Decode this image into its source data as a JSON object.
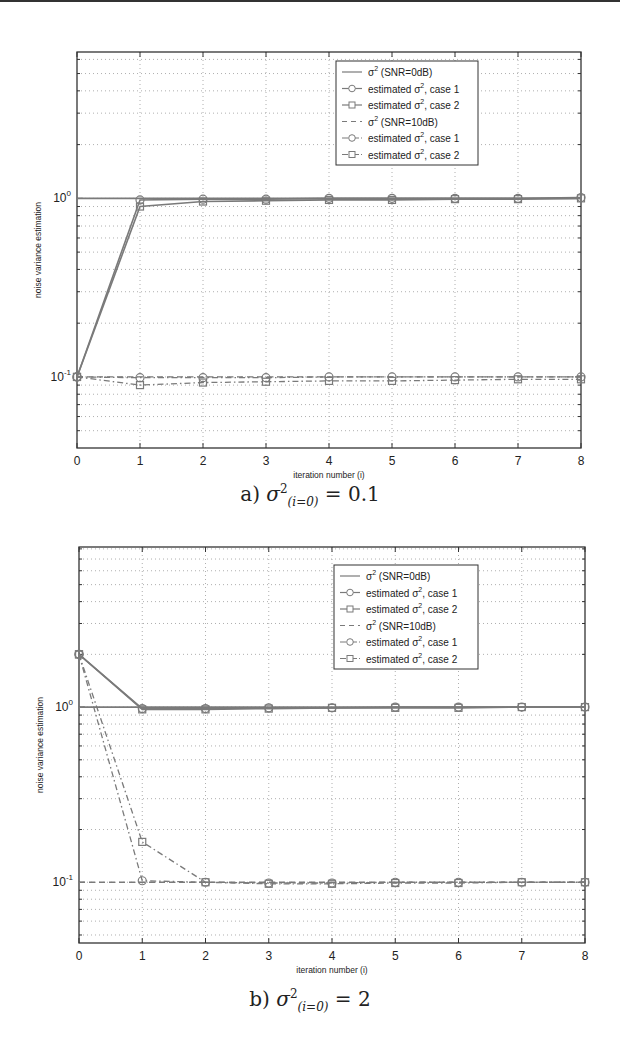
{
  "chart_data": [
    {
      "type": "line",
      "panel": "a",
      "title": "",
      "caption": {
        "prefix": "a)",
        "symbol": "σ",
        "sup": "2",
        "sub": "(i=0)",
        "suffix": "= 0.1"
      },
      "xlabel": "iteration number (i)",
      "ylabel": "noise variance estimation",
      "yscale": "log",
      "xlim": [
        0,
        8
      ],
      "ylim": [
        0.04,
        6.6
      ],
      "grid": true,
      "x_ticks": [
        "0",
        "1",
        "2",
        "3",
        "4",
        "5",
        "6",
        "7",
        "8"
      ],
      "y_ticks": [
        "10^-1",
        "10^0"
      ],
      "legend_position": "upper right (inside)",
      "x": [
        0,
        1,
        2,
        3,
        4,
        5,
        6,
        7,
        8
      ],
      "series": [
        {
          "name": "σ² (SNR=0dB)",
          "style": "solid",
          "marker": "none",
          "values": [
            1,
            1,
            1,
            1,
            1,
            1,
            1,
            1,
            1
          ]
        },
        {
          "name": "estimated σ², case 1",
          "style": "solid",
          "marker": "circle",
          "values": [
            0.1,
            0.98,
            0.99,
            0.99,
            1.0,
            1.0,
            1.0,
            1.0,
            1.01
          ]
        },
        {
          "name": "estimated σ², case 2",
          "style": "solid",
          "marker": "square",
          "values": [
            0.1,
            0.9,
            0.96,
            0.97,
            0.98,
            0.98,
            0.99,
            0.99,
            1.0
          ]
        },
        {
          "name": "σ² (SNR=10dB)",
          "style": "dashed",
          "marker": "none",
          "values": [
            0.1,
            0.1,
            0.1,
            0.1,
            0.1,
            0.1,
            0.1,
            0.1,
            0.1
          ]
        },
        {
          "name": "estimated σ², case 1",
          "style": "dashdot",
          "marker": "circle",
          "values": [
            0.1,
            0.099,
            0.099,
            0.099,
            0.1,
            0.1,
            0.1,
            0.1,
            0.1
          ]
        },
        {
          "name": "estimated σ², case 2",
          "style": "dashdot",
          "marker": "square",
          "values": [
            0.1,
            0.09,
            0.093,
            0.094,
            0.095,
            0.095,
            0.096,
            0.097,
            0.097
          ]
        }
      ]
    },
    {
      "type": "line",
      "panel": "b",
      "title": "",
      "caption": {
        "prefix": "b)",
        "symbol": "σ",
        "sup": "2",
        "sub": "(i=0)",
        "suffix": "= 2"
      },
      "xlabel": "iteration number (i)",
      "ylabel": "noise variance estimation",
      "yscale": "log",
      "xlim": [
        0,
        8
      ],
      "ylim": [
        0.045,
        8.2
      ],
      "grid": true,
      "x_ticks": [
        "0",
        "1",
        "2",
        "3",
        "4",
        "5",
        "6",
        "7",
        "8"
      ],
      "y_ticks": [
        "10^-1",
        "10^0"
      ],
      "legend_position": "upper right (inside)",
      "x": [
        0,
        1,
        2,
        3,
        4,
        5,
        6,
        7,
        8
      ],
      "series": [
        {
          "name": "σ² (SNR=0dB)",
          "style": "solid",
          "marker": "none",
          "values": [
            1,
            1,
            1,
            1,
            1,
            1,
            1,
            1,
            1
          ]
        },
        {
          "name": "estimated σ², case 1",
          "style": "solid",
          "marker": "circle",
          "values": [
            2,
            0.98,
            0.98,
            0.99,
            0.99,
            1.0,
            1.0,
            1.0,
            1.0
          ]
        },
        {
          "name": "estimated σ², case 2",
          "style": "solid",
          "marker": "square",
          "values": [
            2,
            0.97,
            0.97,
            0.98,
            0.99,
            0.99,
            0.99,
            1.0,
            1.0
          ]
        },
        {
          "name": "σ² (SNR=10dB)",
          "style": "dashed",
          "marker": "none",
          "values": [
            0.1,
            0.1,
            0.1,
            0.1,
            0.1,
            0.1,
            0.1,
            0.1,
            0.1
          ]
        },
        {
          "name": "estimated σ², case 1",
          "style": "dashdot",
          "marker": "circle",
          "values": [
            2,
            0.102,
            0.1,
            0.099,
            0.099,
            0.1,
            0.1,
            0.1,
            0.1
          ]
        },
        {
          "name": "estimated σ², case 2",
          "style": "dashdot",
          "marker": "square",
          "values": [
            2,
            0.17,
            0.1,
            0.098,
            0.098,
            0.099,
            0.099,
            0.1,
            0.1
          ]
        }
      ]
    }
  ],
  "figure": {
    "legend_labels": [
      {
        "prefix": "σ",
        "sup": "2",
        "text": " (SNR=0dB)"
      },
      {
        "prefix": "estimated σ",
        "sup": "2",
        "text": ", case 1"
      },
      {
        "prefix": "estimated σ",
        "sup": "2",
        "text": ", case 2"
      },
      {
        "prefix": "σ",
        "sup": "2",
        "text": " (SNR=10dB)"
      },
      {
        "prefix": "estimated σ",
        "sup": "2",
        "text": ", case 1"
      },
      {
        "prefix": "estimated σ",
        "sup": "2",
        "text": ", case 2"
      }
    ],
    "y_tick_labels": {
      "upper": {
        "base": "10",
        "exp": "0"
      },
      "lower": {
        "base": "10",
        "exp": "-1"
      }
    },
    "colors": {
      "line": "#7a7a7a",
      "axis": "#333333",
      "grid": "#9a9a9a",
      "text": "#222222"
    }
  }
}
